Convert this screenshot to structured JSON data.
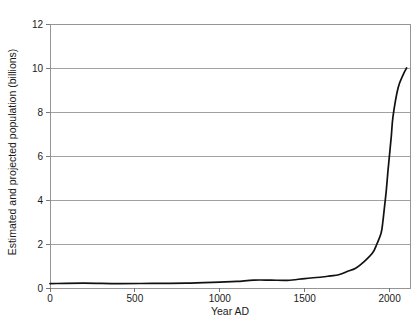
{
  "figure": {
    "cropped_title_fragment": "",
    "background_color": "#ffffff",
    "curve_color": "#111111",
    "axis_color": "#8a8a8a"
  },
  "chart_data": {
    "type": "line",
    "title": "",
    "xlabel": "Year AD",
    "ylabel": "Estimated and projected population (billions)",
    "xlim": [
      0,
      2120
    ],
    "ylim": [
      0,
      12
    ],
    "xticks": [
      0,
      500,
      1000,
      1500,
      2000
    ],
    "xtick_labels": [
      "0",
      "500",
      "1000",
      "1500",
      "2000"
    ],
    "yticks": [
      0,
      2,
      4,
      6,
      8,
      10,
      12
    ],
    "ytick_labels": [
      "0",
      "2",
      "4",
      "6",
      "8",
      "10",
      "12"
    ],
    "grid": "horizontal",
    "legend": "none",
    "series": [
      {
        "name": "World population",
        "x": [
          0,
          200,
          400,
          600,
          800,
          1000,
          1100,
          1200,
          1300,
          1400,
          1500,
          1600,
          1650,
          1700,
          1750,
          1800,
          1850,
          1900,
          1925,
          1950,
          1960,
          1970,
          1980,
          1990,
          2000,
          2010,
          2020,
          2050,
          2080,
          2100
        ],
        "y": [
          0.2,
          0.22,
          0.2,
          0.21,
          0.22,
          0.27,
          0.3,
          0.36,
          0.36,
          0.35,
          0.43,
          0.5,
          0.55,
          0.6,
          0.75,
          0.9,
          1.2,
          1.6,
          2.0,
          2.5,
          3.0,
          3.7,
          4.4,
          5.3,
          6.1,
          6.9,
          7.8,
          9.1,
          9.7,
          10.0
        ]
      }
    ]
  }
}
